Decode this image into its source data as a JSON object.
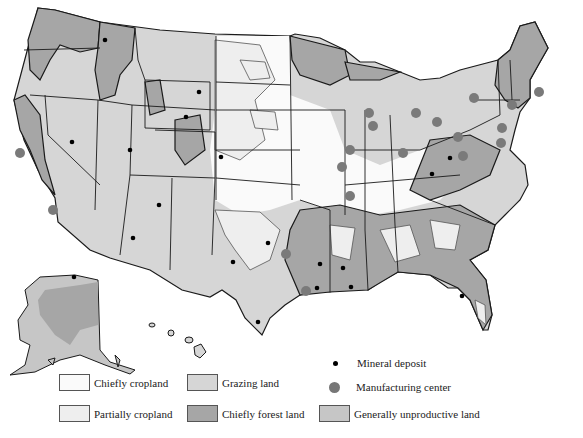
{
  "map": {
    "title": "United States land use and resources",
    "colors": {
      "chiefly_cropland": "#fafafa",
      "partially_cropland": "#eeeeee",
      "grazing_land": "#d6d6d6",
      "chiefly_forest_land": "#a6a6a6",
      "generally_unproductive_land": "#c6c6c6",
      "mineral_deposit": "#000000",
      "manufacturing_center": "#7a7a7a",
      "border": "#1a1a1a"
    },
    "regions_shown": [
      "Contiguous United States",
      "Alaska",
      "Hawaii"
    ]
  },
  "legend": {
    "items": [
      {
        "key": "chiefly_cropland",
        "label": "Chiefly cropland"
      },
      {
        "key": "partially_cropland",
        "label": "Partially cropland"
      },
      {
        "key": "grazing_land",
        "label": "Grazing land"
      },
      {
        "key": "chiefly_forest_land",
        "label": "Chiefly forest land"
      },
      {
        "key": "generally_unproductive_land",
        "label": "Generally unproductive land"
      },
      {
        "key": "mineral_deposit",
        "label": "Mineral deposit"
      },
      {
        "key": "manufacturing_center",
        "label": "Manufacturing center"
      }
    ]
  },
  "markers": {
    "mineral_deposits": [
      [
        105,
        40
      ],
      [
        72,
        142
      ],
      [
        130,
        150
      ],
      [
        199,
        92
      ],
      [
        186,
        117
      ],
      [
        221,
        157
      ],
      [
        159,
        205
      ],
      [
        133,
        238
      ],
      [
        268,
        243
      ],
      [
        233,
        262
      ],
      [
        258,
        322
      ],
      [
        343,
        268
      ],
      [
        320,
        264
      ],
      [
        317,
        288
      ],
      [
        351,
        287
      ],
      [
        432,
        174
      ],
      [
        450,
        158
      ],
      [
        462,
        296
      ],
      [
        74,
        277
      ]
    ],
    "manufacturing_centers": [
      [
        369,
        113
      ],
      [
        373,
        126
      ],
      [
        416,
        113
      ],
      [
        437,
        122
      ],
      [
        474,
        98
      ],
      [
        512,
        105
      ],
      [
        539,
        92
      ],
      [
        502,
        128
      ],
      [
        458,
        137
      ],
      [
        501,
        143
      ],
      [
        463,
        156
      ],
      [
        403,
        153
      ],
      [
        350,
        150
      ],
      [
        342,
        167
      ],
      [
        350,
        196
      ],
      [
        286,
        254
      ],
      [
        306,
        291
      ],
      [
        53,
        210
      ],
      [
        20,
        153
      ]
    ]
  }
}
